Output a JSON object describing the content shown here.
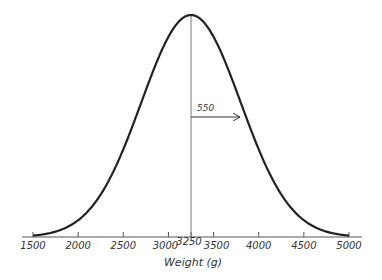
{
  "chart_data": {
    "type": "line",
    "title": "",
    "xlabel": "Weight (g)",
    "ylabel": "",
    "distribution": "normal",
    "mean": 3250,
    "sd": 550,
    "xlim": [
      1500,
      5000
    ],
    "x_ticks": [
      1500,
      2000,
      2500,
      3000,
      3250,
      3500,
      4000,
      4500,
      5000
    ],
    "x_tick_labels": [
      "1500",
      "2000",
      "2500",
      "3000",
      "3250",
      "3500",
      "4000",
      "4500",
      "5000"
    ],
    "grid": false,
    "legend": null,
    "annotations": [
      {
        "type": "vertical-line",
        "x": 3250,
        "label": "mean"
      },
      {
        "type": "arrow",
        "from": 3250,
        "to": 3800,
        "label": "550"
      }
    ],
    "series": [
      {
        "name": "Normal density",
        "x_range": [
          1500,
          5000
        ],
        "shape": "bell curve centered at 3250 with SD 550"
      }
    ]
  },
  "axis": {
    "title": "Weight (g)",
    "ticks": [
      "1500",
      "2000",
      "2500",
      "3000",
      "3250",
      "3500",
      "4000",
      "4500",
      "5000"
    ]
  },
  "annotation": {
    "sd_label": "550"
  },
  "colors": {
    "curve": "#222222",
    "axis": "#555555",
    "mean_line": "#777777"
  }
}
